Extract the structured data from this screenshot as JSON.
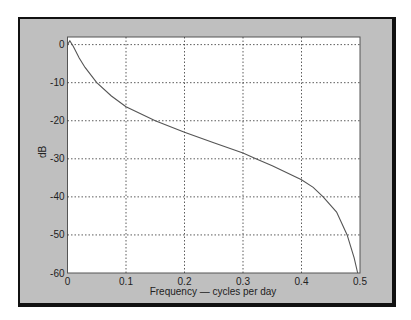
{
  "chart_data": {
    "type": "line",
    "title": "",
    "xlabel": "Frequency — cycles per day",
    "ylabel": "dB",
    "xlim": [
      0,
      0.5
    ],
    "ylim": [
      -60,
      2
    ],
    "xticks": [
      0,
      0.1,
      0.2,
      0.3,
      0.4,
      0.5
    ],
    "xtick_labels": [
      "0",
      "0.1",
      "0.2",
      "0.3",
      "0.4",
      "0.5"
    ],
    "yticks": [
      0,
      -10,
      -20,
      -30,
      -40,
      -50,
      -60
    ],
    "ytick_labels": [
      "0",
      "-10",
      "-20",
      "-30",
      "-40",
      "-50",
      "-60"
    ],
    "grid": true,
    "legend": null,
    "series": [
      {
        "name": "response",
        "color": "#555555",
        "x": [
          0,
          0.004,
          0.01,
          0.02,
          0.03,
          0.05,
          0.075,
          0.1,
          0.15,
          0.2,
          0.25,
          0.3,
          0.322,
          0.35,
          0.4,
          0.42,
          0.437,
          0.46,
          0.478,
          0.49,
          0.496
        ],
        "y": [
          0,
          1,
          -0.5,
          -3.5,
          -6,
          -10,
          -13.5,
          -16.3,
          -20,
          -23,
          -25.8,
          -28.5,
          -30,
          -31.8,
          -35.5,
          -37.5,
          -40,
          -44,
          -50,
          -56,
          -60
        ]
      }
    ]
  },
  "colors": {
    "frame_bg": "#bfbfbf",
    "frame_border": "#111111",
    "plot_bg": "#ffffff",
    "grid": "#333333",
    "axes": "#333333"
  }
}
